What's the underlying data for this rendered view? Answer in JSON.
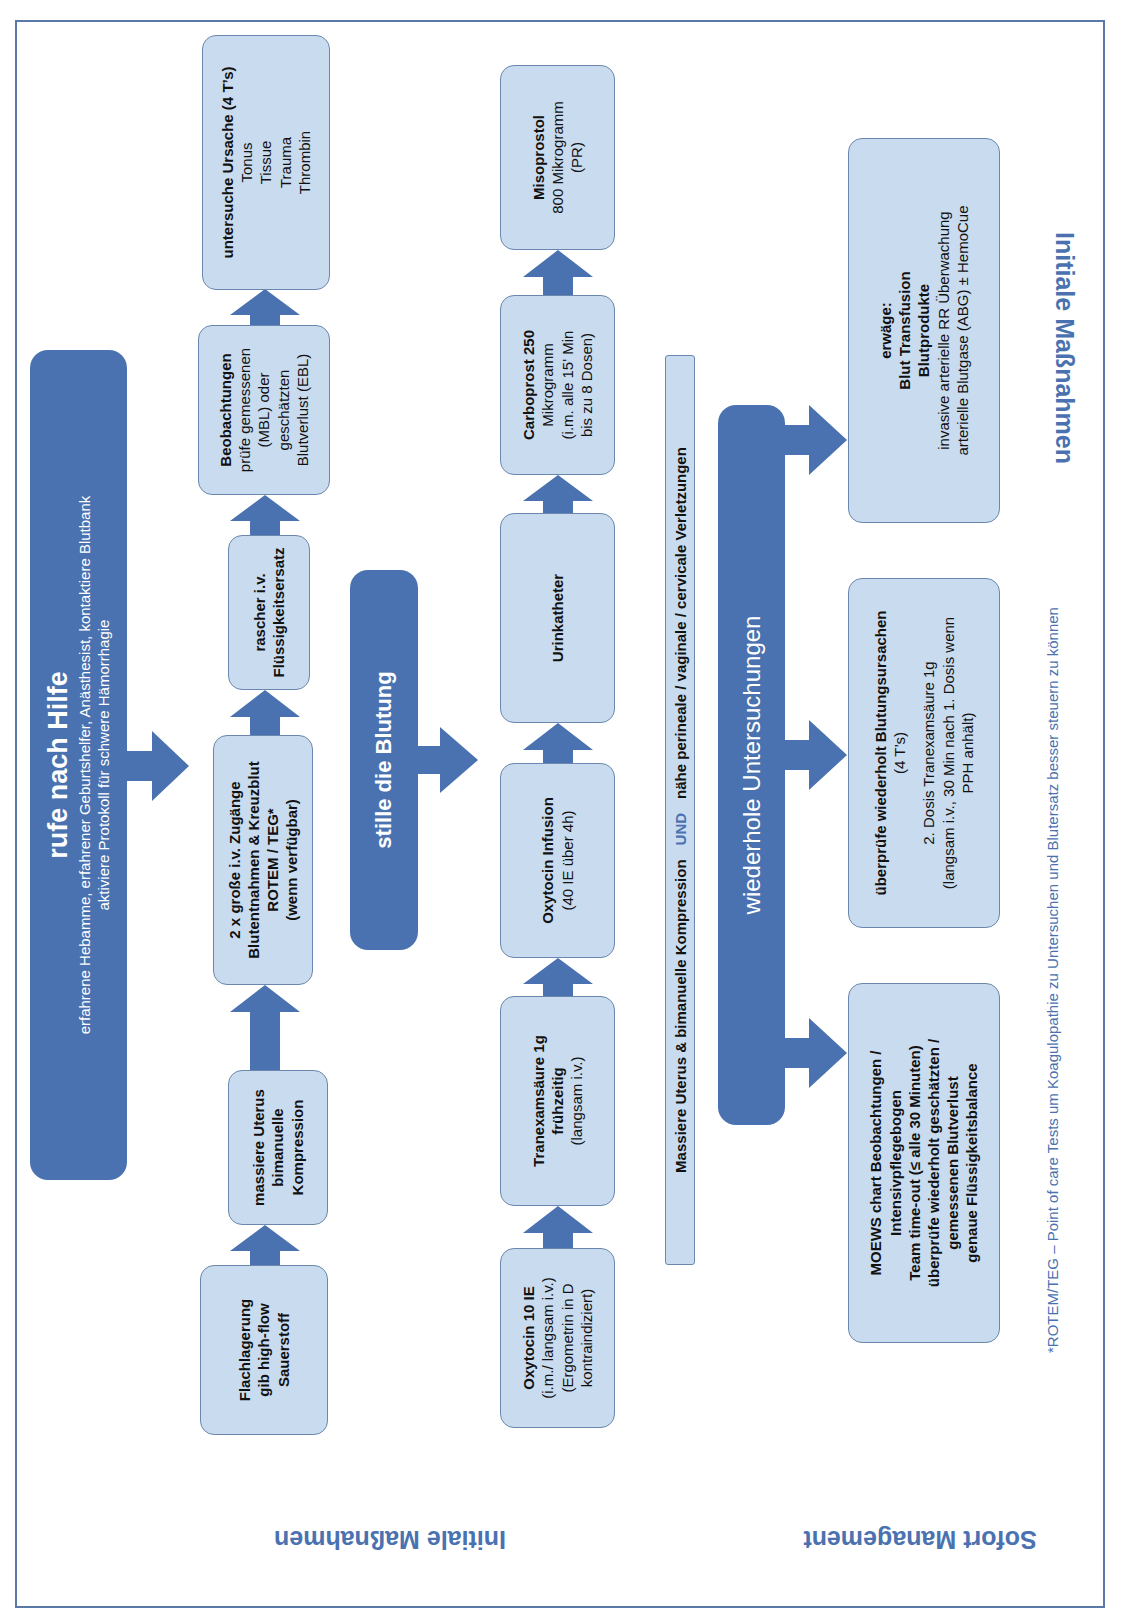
{
  "colors": {
    "primary_blue": "#4a72b0",
    "box_fill": "#c9dbef",
    "box_border": "#6c87ad",
    "frame": "#5a79a8"
  },
  "sections": {
    "initial": "Initiale Maßnahmen",
    "immediate": "Sofort Management"
  },
  "call_help": {
    "title": "rufe nach Hilfe",
    "line1": "erfahrene Hebamme, erfahrener Geburtshelfer, Anästhesist, kontaktiere Blutbank",
    "line2": "aktiviere Protokoll für schwere Hämorrhagie"
  },
  "row1": [
    {
      "lines": [
        {
          "t": "Flachlagerung",
          "b": true
        },
        {
          "t": "gib high-flow",
          "b": true
        },
        {
          "t": "Sauerstoff",
          "b": true
        }
      ]
    },
    {
      "lines": [
        {
          "t": "massiere Uterus",
          "b": true
        },
        {
          "t": "bimanuelle",
          "b": true
        },
        {
          "t": "Kompression",
          "b": true
        }
      ]
    },
    {
      "lines": [
        {
          "t": "2 x große i.v. Zugänge",
          "b": true
        },
        {
          "t": "Blutentnahmen & Kreuzblut",
          "b": true
        },
        {
          "t": "ROTEM / TEG*",
          "b": true
        },
        {
          "t": "(wenn verfügbar)",
          "b": true
        }
      ]
    },
    {
      "lines": [
        {
          "t": "rascher i.v.",
          "b": true
        },
        {
          "t": "Flüssigkeitsersatz",
          "b": true
        }
      ]
    },
    {
      "lines": [
        {
          "t": "Beobachtungen",
          "b": true
        },
        {
          "t": "prüfe gemessenen",
          "b": false
        },
        {
          "t": "(MBL) oder",
          "b": false
        },
        {
          "t": "geschätzten",
          "b": false
        },
        {
          "t": "Blutverlust (EBL)",
          "b": false
        }
      ]
    },
    {
      "lines": [
        {
          "t": "untersuche Ursache (4 T’s)",
          "b": true
        },
        {
          "t": "Tonus",
          "b": false
        },
        {
          "t": "Tissue",
          "b": false
        },
        {
          "t": "Trauma",
          "b": false
        },
        {
          "t": "Thrombin",
          "b": false
        }
      ]
    }
  ],
  "stop_bleeding": {
    "title": "stille die Blutung"
  },
  "row2": [
    {
      "lines": [
        {
          "t": "Oxytocin 10 IE",
          "b": true
        },
        {
          "t": "(i.m./ langsam i.v.)",
          "b": false
        },
        {
          "t": "(Ergometrin in D",
          "b": false
        },
        {
          "t": "kontraindiziert)",
          "b": false
        }
      ]
    },
    {
      "lines": [
        {
          "t": "Tranexamsäure 1g",
          "b": true
        },
        {
          "t": "frühzeitig",
          "b": true
        },
        {
          "t": "(langsam i.v.)",
          "b": false
        }
      ]
    },
    {
      "lines": [
        {
          "t": "Oxytocin Infusion",
          "b": true
        },
        {
          "t": "(40 IE über 4h)",
          "b": false
        }
      ]
    },
    {
      "lines": [
        {
          "t": "Urinkatheter",
          "b": true
        }
      ]
    },
    {
      "lines": [
        {
          "t": "Carboprost 250",
          "b": true
        },
        {
          "t": "Mikrogramm",
          "b": false
        },
        {
          "t": "(i.m. alle 15' Min",
          "b": false
        },
        {
          "t": "bis zu 8 Dosen)",
          "b": false
        }
      ]
    },
    {
      "lines": [
        {
          "t": "Misoprostol",
          "b": true
        },
        {
          "t": "800 Mikrogramm",
          "b": false
        },
        {
          "t": "(PR)",
          "b": false
        }
      ]
    }
  ],
  "compression_bar": {
    "left": "Massiere Uterus & bimanuelle Kompression",
    "und": "UND",
    "right": "nähe perineale / vaginale / cervicale Verletzungen"
  },
  "repeat_exams": {
    "title": "wiederhole Untersuchungen"
  },
  "row3": [
    {
      "lines": [
        {
          "t": "MOEWS chart Beobachtungen /",
          "b": true
        },
        {
          "t": "Intensivpflegebogen",
          "b": true
        },
        {
          "t": "Team time-out (≤ alle 30 Minuten)",
          "b": true
        },
        {
          "t": "überprüfe wiederholt geschätzten /",
          "b": true
        },
        {
          "t": "gemessenen Blutverlust",
          "b": true
        },
        {
          "t": "genaue Flüssigkeitsbalance",
          "b": true
        }
      ]
    },
    {
      "lines": [
        {
          "t": "überprüfe wiederholt Blutungsursachen",
          "b": true
        },
        {
          "t": "(4 T’s)",
          "b": false
        },
        {
          "t": " ",
          "b": false
        },
        {
          "t": "2. Dosis Tranexamsäure 1g",
          "b": false
        },
        {
          "t": "(langsam i.v., 30 Min nach 1. Dosis wenn",
          "b": false
        },
        {
          "t": "PPH anhält)",
          "b": false
        }
      ]
    },
    {
      "lines": [
        {
          "t": "erwäge:",
          "b": true
        },
        {
          "t": "Blut Transfusion",
          "b": true
        },
        {
          "t": "Blutprodukte",
          "b": true
        },
        {
          "t": "invasive arterielle RR Überwachung",
          "b": false
        },
        {
          "t": "arterielle Blutgase (ABG) ± HemoCue",
          "b": false
        }
      ]
    }
  ],
  "footnote": "*ROTEM/TEG – Point of care Tests um Koagulopathie zu Untersuchen und Blutersatz besser steuern zu können"
}
